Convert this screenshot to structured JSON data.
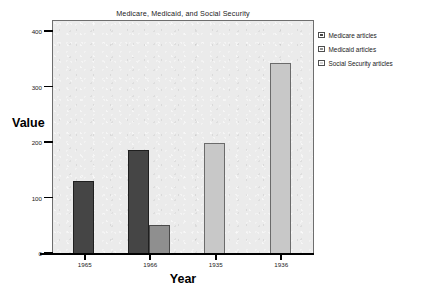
{
  "chart_data": {
    "type": "bar",
    "title": "Medicare, Medicaid, and Social Security",
    "xlabel": "Year",
    "ylabel": "Value",
    "categories": [
      "1965",
      "1966",
      "1935",
      "1936"
    ],
    "series": [
      {
        "name": "Medicare articles",
        "color": "#454545",
        "values": [
          131,
          187,
          null,
          null
        ]
      },
      {
        "name": "Medicaid articles",
        "color": "#8f8f8f",
        "values": [
          null,
          53,
          null,
          null
        ]
      },
      {
        "name": "Social Security articles",
        "color": "#c8c8c8",
        "values": [
          null,
          null,
          200,
          344
        ]
      }
    ],
    "ylim": [
      0,
      420
    ],
    "yticks": [
      0,
      100,
      200,
      300,
      400
    ],
    "ytick_labels": [
      "0",
      "100",
      "200",
      "300",
      "400"
    ],
    "grid": false,
    "legend_position": "outside-top-right"
  }
}
